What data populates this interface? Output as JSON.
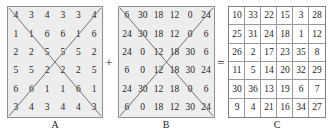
{
  "equation": {
    "plus_sign": "+",
    "equals_sign": "="
  },
  "matrices": [
    {
      "label": "A",
      "has_diagonals": true,
      "rows": [
        [
          4,
          3,
          4,
          3,
          3,
          4
        ],
        [
          1,
          1,
          6,
          6,
          1,
          6
        ],
        [
          2,
          2,
          5,
          5,
          5,
          2
        ],
        [
          5,
          5,
          2,
          2,
          2,
          5
        ],
        [
          6,
          6,
          1,
          1,
          6,
          1
        ],
        [
          3,
          4,
          3,
          4,
          4,
          3
        ]
      ]
    },
    {
      "label": "B",
      "has_diagonals": true,
      "rows": [
        [
          6,
          30,
          18,
          12,
          0,
          24
        ],
        [
          24,
          30,
          18,
          12,
          0,
          6
        ],
        [
          24,
          0,
          12,
          18,
          30,
          6
        ],
        [
          6,
          0,
          12,
          18,
          30,
          24
        ],
        [
          24,
          30,
          12,
          18,
          0,
          6
        ],
        [
          6,
          0,
          18,
          12,
          30,
          24
        ]
      ]
    },
    {
      "label": "C",
      "has_diagonals": false,
      "rows": [
        [
          10,
          33,
          22,
          15,
          3,
          28
        ],
        [
          25,
          31,
          24,
          18,
          1,
          12
        ],
        [
          26,
          2,
          17,
          23,
          35,
          8
        ],
        [
          11,
          5,
          14,
          20,
          32,
          29
        ],
        [
          30,
          36,
          13,
          19,
          6,
          7
        ],
        [
          9,
          4,
          21,
          16,
          34,
          27
        ]
      ]
    }
  ],
  "colors": {
    "matrix_fill": "#ededed",
    "matrix_border": "#8d8d8d",
    "grid_line": "#9a9a9a",
    "text": "#1d1d1d"
  }
}
